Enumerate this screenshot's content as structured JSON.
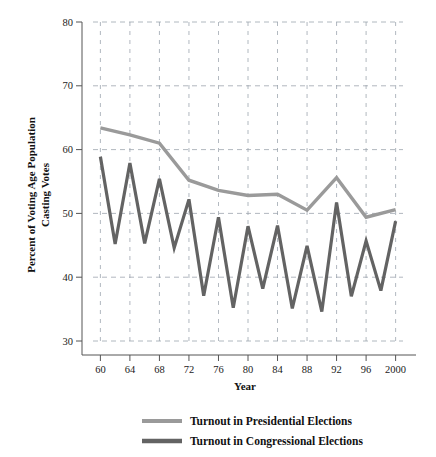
{
  "chart_data": {
    "type": "line",
    "title": "",
    "xlabel": "Year",
    "ylabel": "Percent of Voting Age Population Casting Votes",
    "ylabel_line1": "Percent of Voting Age Population",
    "ylabel_line2": "Casting Votes",
    "xlim": [
      1959,
      2001
    ],
    "ylim": [
      30,
      80
    ],
    "grid": true,
    "grid_style": "dashed",
    "legend_position": "bottom",
    "x_tick_labels": [
      "60",
      "64",
      "68",
      "72",
      "76",
      "80",
      "84",
      "88",
      "92",
      "96",
      "2000"
    ],
    "x_tick_values": [
      1960,
      1964,
      1968,
      1972,
      1976,
      1980,
      1984,
      1988,
      1992,
      1996,
      2000
    ],
    "y_tick_labels": [
      "30",
      "40",
      "50",
      "60",
      "70",
      "80"
    ],
    "y_tick_values": [
      30,
      40,
      50,
      60,
      70,
      80
    ],
    "colors": {
      "presidential": "#9a9a9a",
      "congressional": "#636363",
      "grid": "#9aa3ad",
      "axis": "#555555",
      "text": "#1a1a1a"
    },
    "series": [
      {
        "name": "Turnout in Presidential Elections",
        "color": "#9a9a9a",
        "x": [
          1960,
          1964,
          1968,
          1972,
          1976,
          1980,
          1984,
          1988,
          1992,
          1996,
          2000
        ],
        "values": [
          63.4,
          62.3,
          61.0,
          55.2,
          53.6,
          52.8,
          53.0,
          50.5,
          55.6,
          49.4,
          50.6
        ]
      },
      {
        "name": "Turnout in Congressional Elections",
        "color": "#636363",
        "x": [
          1960,
          1962,
          1964,
          1966,
          1968,
          1970,
          1972,
          1974,
          1976,
          1978,
          1980,
          1982,
          1984,
          1986,
          1988,
          1990,
          1992,
          1994,
          1996,
          1998,
          2000
        ],
        "values": [
          58.9,
          45.2,
          57.9,
          45.3,
          55.4,
          44.6,
          52.2,
          37.1,
          49.4,
          35.2,
          48.0,
          38.2,
          48.1,
          35.1,
          44.9,
          34.6,
          51.7,
          37.0,
          45.7,
          37.9,
          48.8
        ]
      }
    ]
  },
  "legend": {
    "items": [
      {
        "label": "Turnout in Presidential Elections",
        "color": "#9a9a9a"
      },
      {
        "label": "Turnout in Congressional Elections",
        "color": "#636363"
      }
    ]
  }
}
